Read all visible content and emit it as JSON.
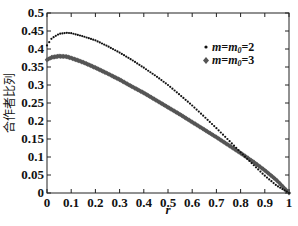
{
  "chart_data": {
    "type": "scatter",
    "title": "",
    "xlabel": "r",
    "ylabel": "合作者比列",
    "xlim": [
      0,
      1
    ],
    "ylim": [
      0,
      0.5
    ],
    "xticks": [
      "0",
      "0.1",
      "0.2",
      "0.3",
      "0.4",
      "0.5",
      "0.6",
      "0.7",
      "0.8",
      "0.9",
      "1"
    ],
    "yticks": [
      "0",
      "0.05",
      "0.1",
      "0.15",
      "0.2",
      "0.25",
      "0.3",
      "0.35",
      "0.4",
      "0.45",
      "0.5"
    ],
    "grid": false,
    "legend_position": "upper right",
    "x": [
      0,
      0.02,
      0.05,
      0.08,
      0.1,
      0.15,
      0.2,
      0.25,
      0.3,
      0.35,
      0.4,
      0.45,
      0.5,
      0.55,
      0.6,
      0.65,
      0.7,
      0.75,
      0.8,
      0.85,
      0.9,
      0.95,
      1.0
    ],
    "series": [
      {
        "name": "m=m0=2",
        "marker": "dot",
        "color": "#111111",
        "values": [
          0.41,
          0.43,
          0.442,
          0.445,
          0.444,
          0.435,
          0.424,
          0.408,
          0.39,
          0.37,
          0.348,
          0.325,
          0.3,
          0.272,
          0.243,
          0.212,
          0.18,
          0.147,
          0.113,
          0.08,
          0.048,
          0.02,
          0.0
        ]
      },
      {
        "name": "m=m0=3",
        "marker": "diamond",
        "color": "#555555",
        "values": [
          0.37,
          0.377,
          0.38,
          0.379,
          0.375,
          0.363,
          0.348,
          0.332,
          0.315,
          0.296,
          0.278,
          0.258,
          0.238,
          0.218,
          0.197,
          0.176,
          0.155,
          0.133,
          0.111,
          0.088,
          0.063,
          0.035,
          0.0
        ]
      }
    ]
  },
  "legend": {
    "items": [
      {
        "label_m": "m",
        "label_eq1": "=",
        "label_m0": "m",
        "sub": "0",
        "label_val": "=2",
        "marker": "•"
      },
      {
        "label_m": "m",
        "label_eq1": "=",
        "label_m0": "m",
        "sub": "0",
        "label_val": "=3",
        "marker": "♦"
      }
    ]
  }
}
